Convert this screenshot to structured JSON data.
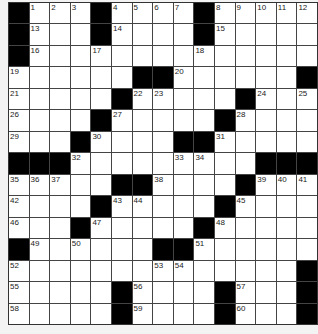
{
  "puzzle": {
    "rows": 15,
    "cols": 15,
    "colors": {
      "block": "#000000",
      "cell": "#ffffff",
      "line": "#444444",
      "background": "#f3f3f3"
    },
    "layout": [
      "#...#....#.....",
      "#...#....#.....",
      "#..............",
      "......##......#",
      ".....#.....#...",
      "....#.....#....",
      "...#....##.....",
      "###.........###",
      ".....##....#...",
      "....#.....#....",
      "...#.....#.....",
      "#......##......",
      "..............#",
      ".....#....#...#",
      ".....#....#...#"
    ],
    "numbers": [
      {
        "r": 0,
        "c": 1,
        "n": "1"
      },
      {
        "r": 0,
        "c": 2,
        "n": "2"
      },
      {
        "r": 0,
        "c": 3,
        "n": "3"
      },
      {
        "r": 0,
        "c": 5,
        "n": "4"
      },
      {
        "r": 0,
        "c": 6,
        "n": "5"
      },
      {
        "r": 0,
        "c": 7,
        "n": "6"
      },
      {
        "r": 0,
        "c": 8,
        "n": "7"
      },
      {
        "r": 0,
        "c": 10,
        "n": "8"
      },
      {
        "r": 0,
        "c": 11,
        "n": "9"
      },
      {
        "r": 0,
        "c": 12,
        "n": "10"
      },
      {
        "r": 0,
        "c": 13,
        "n": "11"
      },
      {
        "r": 0,
        "c": 14,
        "n": "12"
      },
      {
        "r": 1,
        "c": 1,
        "n": "13"
      },
      {
        "r": 1,
        "c": 5,
        "n": "14"
      },
      {
        "r": 1,
        "c": 10,
        "n": "15"
      },
      {
        "r": 2,
        "c": 1,
        "n": "16"
      },
      {
        "r": 2,
        "c": 4,
        "n": "17"
      },
      {
        "r": 2,
        "c": 9,
        "n": "18"
      },
      {
        "r": 3,
        "c": 0,
        "n": "19"
      },
      {
        "r": 3,
        "c": 8,
        "n": "20"
      },
      {
        "r": 4,
        "c": 0,
        "n": "21"
      },
      {
        "r": 4,
        "c": 6,
        "n": "22"
      },
      {
        "r": 4,
        "c": 7,
        "n": "23"
      },
      {
        "r": 4,
        "c": 12,
        "n": "24"
      },
      {
        "r": 4,
        "c": 14,
        "n": "25"
      },
      {
        "r": 5,
        "c": 0,
        "n": "26"
      },
      {
        "r": 5,
        "c": 5,
        "n": "27"
      },
      {
        "r": 5,
        "c": 11,
        "n": "28"
      },
      {
        "r": 6,
        "c": 0,
        "n": "29"
      },
      {
        "r": 6,
        "c": 4,
        "n": "30"
      },
      {
        "r": 6,
        "c": 10,
        "n": "31"
      },
      {
        "r": 7,
        "c": 3,
        "n": "32"
      },
      {
        "r": 7,
        "c": 8,
        "n": "33"
      },
      {
        "r": 7,
        "c": 9,
        "n": "34"
      },
      {
        "r": 8,
        "c": 0,
        "n": "35"
      },
      {
        "r": 8,
        "c": 1,
        "n": "36"
      },
      {
        "r": 8,
        "c": 2,
        "n": "37"
      },
      {
        "r": 8,
        "c": 7,
        "n": "38"
      },
      {
        "r": 8,
        "c": 12,
        "n": "39"
      },
      {
        "r": 8,
        "c": 13,
        "n": "40"
      },
      {
        "r": 8,
        "c": 14,
        "n": "41"
      },
      {
        "r": 9,
        "c": 0,
        "n": "42"
      },
      {
        "r": 9,
        "c": 5,
        "n": "43"
      },
      {
        "r": 9,
        "c": 6,
        "n": "44"
      },
      {
        "r": 9,
        "c": 11,
        "n": "45"
      },
      {
        "r": 10,
        "c": 0,
        "n": "46"
      },
      {
        "r": 10,
        "c": 4,
        "n": "47"
      },
      {
        "r": 10,
        "c": 10,
        "n": "48"
      },
      {
        "r": 11,
        "c": 1,
        "n": "49"
      },
      {
        "r": 11,
        "c": 3,
        "n": "50"
      },
      {
        "r": 11,
        "c": 9,
        "n": "51"
      },
      {
        "r": 12,
        "c": 0,
        "n": "52"
      },
      {
        "r": 12,
        "c": 7,
        "n": "53"
      },
      {
        "r": 12,
        "c": 8,
        "n": "54"
      },
      {
        "r": 13,
        "c": 0,
        "n": "55"
      },
      {
        "r": 13,
        "c": 6,
        "n": "56"
      },
      {
        "r": 13,
        "c": 11,
        "n": "57"
      },
      {
        "r": 14,
        "c": 0,
        "n": "58"
      },
      {
        "r": 14,
        "c": 6,
        "n": "59"
      },
      {
        "r": 14,
        "c": 11,
        "n": "60"
      }
    ]
  }
}
